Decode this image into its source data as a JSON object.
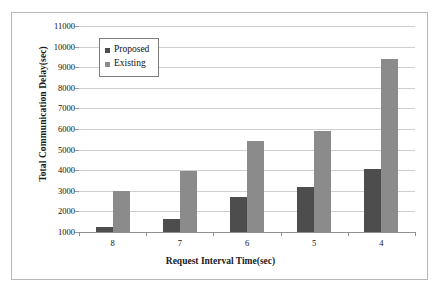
{
  "chart_data": {
    "type": "bar",
    "title": "",
    "xlabel": "Request Interval Time(sec)",
    "ylabel": "Total Communication Delay(sec)",
    "categories": [
      "8",
      "7",
      "6",
      "5",
      "4"
    ],
    "series": [
      {
        "name": "Proposed",
        "color": "#4d4d4d",
        "values": [
          1250,
          1650,
          2700,
          3200,
          4050
        ]
      },
      {
        "name": "Existing",
        "color": "#8b8b8b",
        "values": [
          3000,
          3950,
          5400,
          5900,
          9400
        ]
      }
    ],
    "ylim": [
      1000,
      11000
    ],
    "yticks": [
      1000,
      2000,
      3000,
      4000,
      5000,
      6000,
      7000,
      8000,
      9000,
      10000,
      11000
    ],
    "ytick_labels": [
      "1000",
      "2000",
      "3000",
      "4000",
      "5000",
      "6000",
      "7000",
      "8000",
      "9000",
      "10000",
      "11000"
    ],
    "grid": true,
    "legend_position": "top-left",
    "legend_entries": [
      "Proposed",
      "Existing"
    ]
  }
}
